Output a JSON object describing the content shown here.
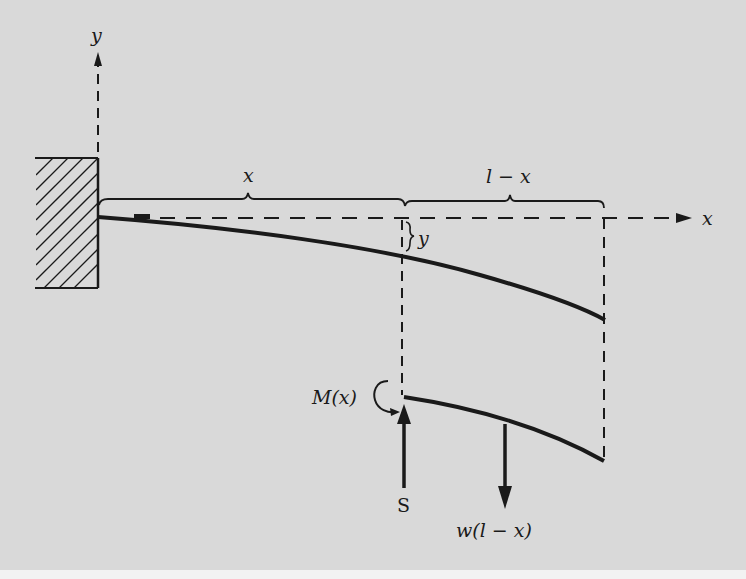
{
  "diagram": {
    "type": "cantilever-beam-free-body",
    "colors": {
      "background": "#d9d9d9",
      "ink": "#1a1a1a",
      "margin": "#f2f2f2"
    },
    "axes": {
      "y_label": "y",
      "x_label": "x"
    },
    "dimensions": {
      "left_span_label": "x",
      "right_span_label": "l − x",
      "deflection_label": "y"
    },
    "free_body": {
      "moment_label": "M(x)",
      "shear_label": "S",
      "load_label": "w(l − x)"
    },
    "support": {
      "name": "fixed-wall",
      "hatched": true
    }
  }
}
